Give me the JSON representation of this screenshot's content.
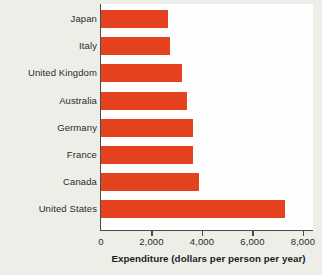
{
  "chart_data": {
    "type": "bar",
    "orientation": "horizontal",
    "title": "",
    "xlabel": "Expenditure (dollars per person per year)",
    "ylabel": "",
    "categories": [
      "Japan",
      "Italy",
      "United Kingdom",
      "Australia",
      "Germany",
      "France",
      "Canada",
      "United States"
    ],
    "values": [
      2650,
      2750,
      3200,
      3400,
      3650,
      3650,
      3900,
      7300
    ],
    "xlim": [
      0,
      8400
    ],
    "xticks": [
      0,
      2000,
      4000,
      6000,
      8000
    ],
    "xtick_labels": [
      "0",
      "2,000",
      "4,000",
      "6,000",
      "8,000"
    ],
    "grid": false,
    "legend": null,
    "bar_color": "#e5431f",
    "plot_background": "#fefefe",
    "page_background": "#eeeee9",
    "axis_color": "#4b4b4b"
  }
}
